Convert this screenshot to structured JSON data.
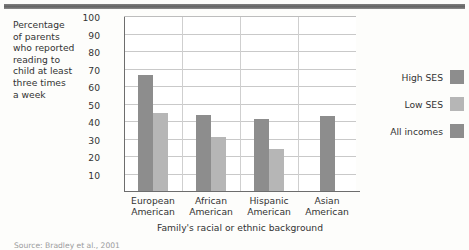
{
  "figure": {
    "y_axis_caption_lines": [
      "Percentage",
      "of parents",
      "who reported",
      "reading to",
      "child at least",
      "three times",
      "a week"
    ],
    "source_note": "Source: Bradley et al., 2001"
  },
  "legend": {
    "position": "right",
    "items": [
      {
        "label": "High SES",
        "color": "#8d8d8d",
        "name": "high-ses"
      },
      {
        "label": "Low SES",
        "color": "#b6b6b6",
        "name": "low-ses"
      },
      {
        "label": "All incomes",
        "color": "#8d8d8d",
        "name": "all-incomes"
      }
    ]
  },
  "chart_data": {
    "type": "bar",
    "title": "",
    "xlabel": "Family's racial or ethnic background",
    "ylabel": "Percentage of parents who reported reading to child at least three times a week",
    "categories": [
      "European American",
      "African American",
      "Hispanic American",
      "Asian American"
    ],
    "category_lines": [
      [
        "European",
        "American"
      ],
      [
        "African",
        "American"
      ],
      [
        "Hispanic",
        "American"
      ],
      [
        "Asian",
        "American"
      ]
    ],
    "series": [
      {
        "name": "High SES",
        "color": "#8d8d8d",
        "values": [
          67,
          44,
          41.5,
          null
        ]
      },
      {
        "name": "Low SES",
        "color": "#b6b6b6",
        "values": [
          45,
          31.5,
          24.5,
          null
        ]
      },
      {
        "name": "All incomes",
        "color": "#8d8d8d",
        "values": [
          null,
          null,
          null,
          43.5
        ]
      }
    ],
    "ylim": [
      0,
      100
    ],
    "yticks": [
      100,
      90,
      80,
      70,
      60,
      50,
      40,
      30,
      20,
      10
    ],
    "grid": true
  }
}
